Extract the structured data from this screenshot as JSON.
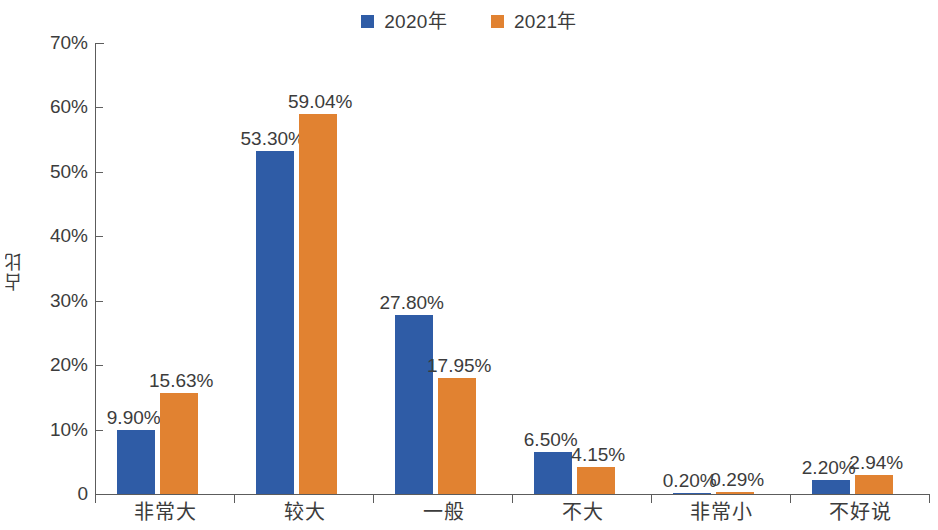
{
  "chart_data": {
    "type": "bar",
    "title": "",
    "subtitle": "",
    "xlabel": "",
    "ylabel": "占比",
    "ylim": [
      0,
      70
    ],
    "grid": false,
    "legend_position": "top-center",
    "y_ticks": [
      "0",
      "10%",
      "20%",
      "30%",
      "40%",
      "50%",
      "60%",
      "70%"
    ],
    "y_tick_values": [
      0,
      10,
      20,
      30,
      40,
      50,
      60,
      70
    ],
    "categories": [
      "非常大",
      "较大",
      "一般",
      "不大",
      "非常小",
      "不好说"
    ],
    "series": [
      {
        "name": "2020年",
        "color": "#2f5ca6",
        "values": [
          9.9,
          53.3,
          27.8,
          6.5,
          0.2,
          2.2
        ],
        "labels": [
          "9.90%",
          "53.30%",
          "27.80%",
          "6.50%",
          "0.20%",
          "2.20%"
        ]
      },
      {
        "name": "2021年",
        "color": "#e18231",
        "values": [
          15.63,
          59.04,
          17.95,
          4.15,
          0.29,
          2.94
        ],
        "labels": [
          "15.63%",
          "59.04%",
          "17.95%",
          "4.15%",
          "0.29%",
          "2.94%"
        ]
      }
    ]
  },
  "legend": {
    "items": [
      {
        "label": "2020年",
        "color": "#2f5ca6"
      },
      {
        "label": "2021年",
        "color": "#e18231"
      }
    ]
  },
  "axes": {
    "y": {
      "label": "占比",
      "ticks": [
        {
          "text": "70%",
          "value": 70
        },
        {
          "text": "60%",
          "value": 60
        },
        {
          "text": "50%",
          "value": 50
        },
        {
          "text": "40%",
          "value": 40
        },
        {
          "text": "30%",
          "value": 30
        },
        {
          "text": "20%",
          "value": 20
        },
        {
          "text": "10%",
          "value": 10
        },
        {
          "text": "0",
          "value": 0
        }
      ]
    },
    "x": {
      "ticks": [
        "非常大",
        "较大",
        "一般",
        "不大",
        "非常小",
        "不好说"
      ]
    }
  }
}
